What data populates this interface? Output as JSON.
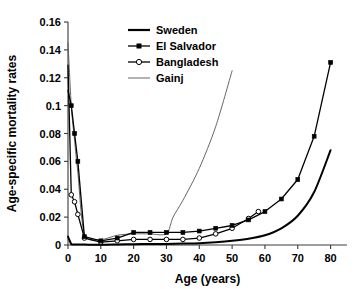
{
  "chart_data": {
    "type": "line",
    "title": "",
    "xlabel": "Age (years)",
    "ylabel": "Age-specific mortality rates",
    "xlim": [
      0,
      85
    ],
    "ylim": [
      0,
      0.16
    ],
    "xticks": [
      0,
      10,
      20,
      30,
      40,
      50,
      60,
      70,
      80
    ],
    "yticks": [
      0,
      0.02,
      0.04,
      0.06,
      0.08,
      0.1,
      0.12,
      0.14,
      0.16
    ],
    "xtick_labels": [
      "0",
      "10",
      "20",
      "30",
      "40",
      "50",
      "60",
      "70",
      "80"
    ],
    "ytick_labels": [
      "0",
      "0.02",
      "0.04",
      "0.06",
      "0.08",
      "0.1",
      "0.12",
      "0.14",
      "0.16"
    ],
    "grid": false,
    "legend_position": "top-center",
    "series": [
      {
        "name": "Sweden",
        "marker": "none",
        "line_width": 2.0,
        "color": "#000000",
        "x": [
          0,
          1,
          2,
          3,
          5,
          10,
          15,
          20,
          25,
          30,
          35,
          40,
          45,
          50,
          55,
          60,
          65,
          70,
          75,
          80
        ],
        "y": [
          0.006,
          0.0007,
          0.0004,
          0.0003,
          0.0003,
          0.0002,
          0.0004,
          0.0006,
          0.0007,
          0.0008,
          0.001,
          0.0013,
          0.002,
          0.003,
          0.0045,
          0.007,
          0.012,
          0.021,
          0.038,
          0.068
        ]
      },
      {
        "name": "El Salvador",
        "marker": "filled-square",
        "line_width": 1.3,
        "color": "#000000",
        "x": [
          0,
          1,
          2,
          3,
          5,
          10,
          15,
          20,
          25,
          30,
          35,
          40,
          45,
          50,
          55,
          60,
          65,
          70,
          75,
          80
        ],
        "y": [
          0.111,
          0.1,
          0.08,
          0.06,
          0.006,
          0.003,
          0.005,
          0.009,
          0.009,
          0.009,
          0.009,
          0.01,
          0.012,
          0.014,
          0.018,
          0.024,
          0.033,
          0.047,
          0.078,
          0.131
        ]
      },
      {
        "name": "Bangladesh",
        "marker": "open-circle",
        "line_width": 1.3,
        "color": "#000000",
        "x": [
          0,
          1,
          2,
          3,
          5,
          10,
          15,
          20,
          25,
          30,
          35,
          40,
          45,
          50,
          55,
          58
        ],
        "y": [
          0.129,
          0.036,
          0.031,
          0.022,
          0.005,
          0.002,
          0.003,
          0.004,
          0.004,
          0.004,
          0.004,
          0.005,
          0.008,
          0.012,
          0.019,
          0.024
        ]
      },
      {
        "name": "Gainj",
        "marker": "none",
        "line_width": 0.9,
        "color": "#555555",
        "x": [
          0,
          1,
          2,
          3,
          5,
          10,
          15,
          20,
          25,
          30,
          32,
          35,
          40,
          45,
          50
        ],
        "y": [
          0.145,
          0.1,
          0.075,
          0.052,
          0.008,
          0.004,
          0.007,
          0.008,
          0.008,
          0.008,
          0.02,
          0.032,
          0.055,
          0.085,
          0.125
        ]
      }
    ],
    "legend": [
      {
        "label": "Sweden",
        "marker": "none",
        "style": "thick-line"
      },
      {
        "label": "El Salvador",
        "marker": "filled-square",
        "style": "line-marker"
      },
      {
        "label": "Bangladesh",
        "marker": "open-circle",
        "style": "line-marker"
      },
      {
        "label": "Gainj",
        "marker": "none",
        "style": "thin-line"
      }
    ]
  }
}
